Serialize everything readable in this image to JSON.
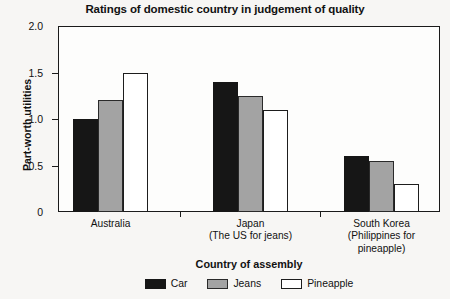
{
  "chart_data": {
    "type": "bar",
    "title": "Ratings of domestic country in judgement of quality",
    "xlabel": "Country of assembly",
    "ylabel": "Part-worth utilities",
    "categories": [
      "Australia",
      "Japan",
      "South Korea"
    ],
    "category_sublabels": [
      "",
      "(The US for jeans)",
      "(Philippines for pineapple)"
    ],
    "series": [
      {
        "name": "Car",
        "color": "#161616",
        "values": [
          1.0,
          1.4,
          0.6
        ]
      },
      {
        "name": "Jeans",
        "color": "#a3a3a3",
        "values": [
          1.2,
          1.25,
          0.55
        ]
      },
      {
        "name": "Pineapple",
        "color": "#ffffff",
        "values": [
          1.5,
          1.1,
          0.3
        ]
      }
    ],
    "ylim": [
      0,
      2.0
    ],
    "yticks": [
      0,
      0.5,
      1.0,
      1.5,
      2.0
    ],
    "ytick_labels": [
      "0",
      "0.5",
      "1.0",
      "1.5",
      "2.0"
    ],
    "grid": false,
    "legend_position": "bottom"
  },
  "legend": {
    "items": [
      {
        "label": "Car"
      },
      {
        "label": "Jeans"
      },
      {
        "label": "Pineapple"
      }
    ]
  },
  "axis": {
    "y_title": "Part-worth utilities",
    "x_title": "Country of assembly"
  },
  "groups": [
    {
      "name": "Australia",
      "sub": ""
    },
    {
      "name": "Japan",
      "sub": "(The US for jeans)"
    },
    {
      "name": "South Korea",
      "sub": "(Philippines for\npineapple)"
    }
  ]
}
